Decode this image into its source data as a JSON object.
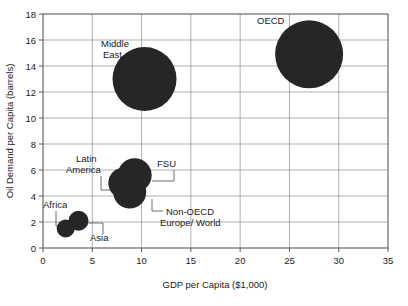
{
  "chart_data": {
    "type": "scatter",
    "title": "",
    "xlabel": "GDP per Capita ($1,000)",
    "ylabel": "Oil Demand per Capita (barrels)",
    "xlim": [
      0,
      35
    ],
    "ylim": [
      0,
      18
    ],
    "xticks": [
      "0",
      "5",
      "10",
      "15",
      "20",
      "25",
      "30",
      "35"
    ],
    "yticks": [
      "0",
      "2",
      "4",
      "6",
      "8",
      "10",
      "12",
      "14",
      "16",
      "18"
    ],
    "grid": true,
    "legend": "none",
    "marker_color": "#262626",
    "points": [
      {
        "label": "OECD",
        "x": 27.0,
        "y": 14.9,
        "size": 34,
        "label_x": 24.6,
        "label_y": 16.9,
        "leader": false
      },
      {
        "label": "Middle East",
        "x": 10.3,
        "y": 13.0,
        "size": 32,
        "label_x": 7.8,
        "label_y": 16.0,
        "leader": false
      },
      {
        "label": "FSU",
        "x": 9.3,
        "y": 5.6,
        "size": 17,
        "label_x": 11.3,
        "label_y": 7.0,
        "leader": true
      },
      {
        "label": "Latin America",
        "x": 8.2,
        "y": 5.0,
        "size": 15.5,
        "label_x": 5.0,
        "label_y": 7.4,
        "leader": true
      },
      {
        "label": "Non-OECD Europe/ World",
        "x": 8.8,
        "y": 4.3,
        "size": 16.5,
        "label_x": 13.3,
        "label_y": 2.8,
        "leader": true
      },
      {
        "label": "Asia",
        "x": 3.6,
        "y": 2.1,
        "size": 10,
        "label_x": 4.9,
        "label_y": 1.0,
        "leader": true
      },
      {
        "label": "Africa",
        "x": 2.3,
        "y": 1.5,
        "size": 9,
        "label_x": 0.55,
        "label_y": 3.0,
        "leader": true
      }
    ]
  },
  "labels": {
    "oecd": "OECD",
    "middle_east_line1": "Middle",
    "middle_east_line2": "East",
    "fsu": "FSU",
    "latin_america_line1": "Latin",
    "latin_america_line2": "America",
    "non_oecd_line1": "Non-OECD",
    "non_oecd_line2": "Europe/ World",
    "asia": "Asia",
    "africa": "Africa"
  },
  "axes": {
    "x_title": "GDP per Capita ($1,000)",
    "y_title": "Oil Demand per Capita (barrels)",
    "x_ticks": [
      "0",
      "5",
      "10",
      "15",
      "20",
      "25",
      "30",
      "35"
    ],
    "y_ticks": [
      "0",
      "2",
      "4",
      "6",
      "8",
      "10",
      "12",
      "14",
      "16",
      "18"
    ]
  }
}
